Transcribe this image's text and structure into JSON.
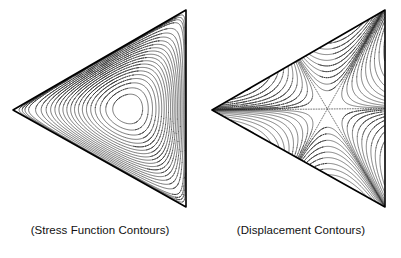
{
  "figure": {
    "background_color": "#ffffff",
    "line_color": "#2b2b2b",
    "boundary_color": "#000000",
    "zero_contour_color": "#555555",
    "panel_count": 2
  },
  "panels": [
    {
      "id": "stress-function",
      "caption": "(Stress Function Contours)",
      "domain_shape": "equilateral-triangle",
      "orientation": "apex-left",
      "vertices": [
        [
          13,
          110
        ],
        [
          186,
          10
        ],
        [
          186,
          207
        ]
      ],
      "contour_style": "solid",
      "contour_count": 19,
      "pattern": "nested closed loops around a single interior maximum",
      "extremum": {
        "type": "maximum",
        "x": 122,
        "y": 110
      }
    },
    {
      "id": "displacement",
      "caption": "(Displacement Contours)",
      "domain_shape": "equilateral-triangle",
      "orientation": "apex-left",
      "vertices": [
        [
          212,
          110
        ],
        [
          385,
          10
        ],
        [
          385,
          207
        ]
      ],
      "contour_style": "solid-with-dotted-zero-lines",
      "contour_count": 12,
      "pattern": "six alternating lobes separated by three dotted zero-level rays meeting at the centroid",
      "saddle": {
        "type": "saddle",
        "x": 294,
        "y": 110
      },
      "zero_line_style": "dotted",
      "zero_line_count": 3
    }
  ],
  "chart_data": {
    "type": "line",
    "title": "",
    "subtitle": "",
    "xlabel": "",
    "ylabel": "",
    "grid": false,
    "legend": "none",
    "charts": [
      {
        "name": "(Stress Function Contours)",
        "type": "contour",
        "field": "phi",
        "domain": "equilateral triangle, apex pointing left",
        "levels": [
          0.05,
          0.1,
          0.15,
          0.2,
          0.25,
          0.3,
          0.35,
          0.4,
          0.45,
          0.5,
          0.55,
          0.6,
          0.65,
          0.7,
          0.75,
          0.8,
          0.85,
          0.9,
          0.95
        ],
        "level_count": 19,
        "boundary_value": 0,
        "max_value": 1.0,
        "max_location": "centroid",
        "contour_topology": "concentric closed curves, rounded-triangular near boundary, circular near centre"
      },
      {
        "name": "(Displacement Contours)",
        "type": "contour",
        "field": "w",
        "domain": "equilateral triangle, apex pointing left",
        "levels": [
          -0.9,
          -0.7,
          -0.5,
          -0.35,
          -0.22,
          -0.12,
          -0.05,
          0.0,
          0.05,
          0.12,
          0.22,
          0.35,
          0.5,
          0.7,
          0.9
        ],
        "level_count": 15,
        "zero_levels": 3,
        "centre_value": 0.0,
        "centre_type": "saddle / sixfold node",
        "contour_topology": "six alternating positive and negative lobes, one per half-sector, separated by three straight dotted zero lines through the centroid"
      }
    ]
  }
}
